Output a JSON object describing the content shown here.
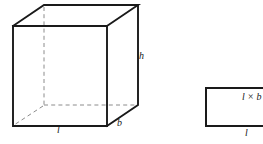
{
  "figure": {
    "background_color": "#ffffff",
    "line_color": "#1a1a1a",
    "hidden_line_color": "#8c8c8c",
    "width": 263,
    "height": 144,
    "cuboid": {
      "name": "cuboid",
      "projection": "oblique",
      "depth_offset_x": 31,
      "depth_offset_y": -21,
      "front_face": {
        "top_left": [
          13,
          26
        ],
        "top_right": [
          107,
          26
        ],
        "bottom_right": [
          107,
          126
        ],
        "bottom_left": [
          13,
          126
        ]
      },
      "back_face": {
        "top_left": [
          44,
          5
        ],
        "top_right": [
          138,
          5
        ],
        "bottom_right": [
          138,
          105
        ],
        "bottom_left": [
          44,
          105
        ]
      },
      "hidden_edges": [
        "back-top-left to back-bottom-left",
        "back-bottom-left to back-bottom-right",
        "back-bottom-left to front-bottom-left"
      ],
      "labels": {
        "height": "h",
        "breadth": "b",
        "length": "l"
      }
    },
    "rectangle": {
      "name": "base-rectangle",
      "top_left": [
        206,
        88
      ],
      "bottom_right": [
        270,
        126
      ],
      "clipped_right": true,
      "area_label": "l × b",
      "length_label": "l"
    }
  }
}
